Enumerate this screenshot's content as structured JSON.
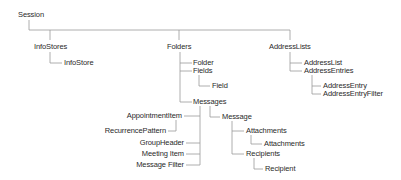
{
  "diagram": {
    "title": "Session",
    "nodes": {
      "session": "Session",
      "infostores": "InfoStores",
      "infostore": "InfoStore",
      "folders": "Folders",
      "folder": "Folder",
      "fields": "Fields",
      "field": "Field",
      "messages": "Messages",
      "appointmentitem": "AppointmentItem",
      "recurrencepattern": "RecurrencePattern",
      "groupheader": "GroupHeader",
      "meetingitem": "Meeting Item",
      "messagefilter": "Message Filter",
      "message": "Message",
      "attachments": "Attachments",
      "attachment_child": "Attachments",
      "recipients": "Recipients",
      "recipient": "Recipient",
      "addresslists": "AddressLists",
      "addresslist": "AddressList",
      "addressentries": "AddressEntries",
      "addressentry": "AddressEntry",
      "addressentryfilter": "AddressEntryFilter"
    },
    "colors": {
      "text": "#2a2a2a",
      "connector": "#9a9a9a",
      "background": "#ffffff"
    }
  }
}
